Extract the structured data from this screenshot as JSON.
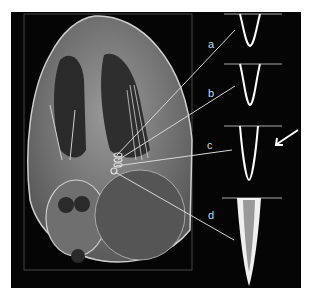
{
  "figure": {
    "labels": [
      {
        "id": "a",
        "text": "a"
      },
      {
        "id": "b",
        "text": "b"
      },
      {
        "id": "c",
        "text": "c"
      },
      {
        "id": "d",
        "text": "d"
      }
    ],
    "colors": {
      "background": "#050505",
      "tissue": "#8a8a8a",
      "line": "#e0e0e0",
      "tip_fill": "#9a9a9a"
    }
  }
}
